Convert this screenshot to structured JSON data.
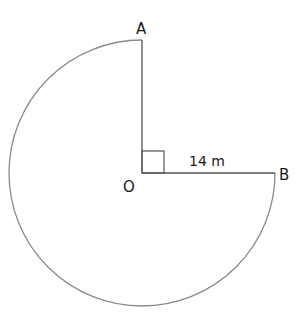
{
  "diagram": {
    "type": "circle-sector",
    "labels": {
      "a": "A",
      "b": "B",
      "o": "O",
      "radius": "14 m"
    },
    "radius_value": 14,
    "radius_unit": "m",
    "right_angle_marker": true,
    "colors": {
      "arc": "#8a8a8a",
      "lines": "#555555",
      "text": "#1a1a1a"
    }
  }
}
